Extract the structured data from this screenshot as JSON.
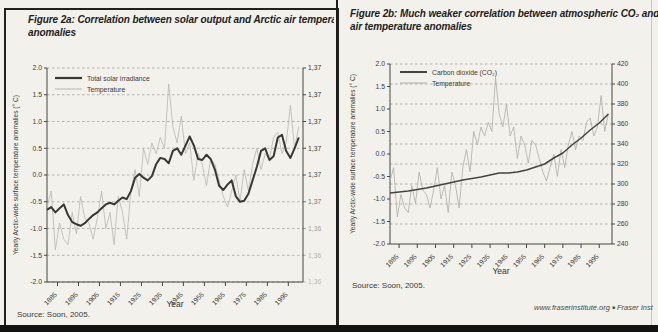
{
  "page": {
    "footer": {
      "url": "www.fraserinstitute.org",
      "separator": "■",
      "publication": "Fraser Inst"
    }
  },
  "panels": [
    {
      "title_line1": "Figure 2a: Correlation between solar output and Arctic air temperat",
      "title_line2": "anomalies",
      "source_note": "Source: Soon, 2005."
    },
    {
      "title_line1": "Figure 2b: Much weaker correlation between atmospheric CO₂ and Arc",
      "title_line2": "air temperature anomalies",
      "source_note": "Source: Soon, 2005."
    }
  ],
  "chart_data": [
    {
      "type": "line",
      "title": "Figure 2a: Correlation between solar output and Arctic air temperature anomalies",
      "xlabel": "Year",
      "ylabel": "Yearly Arctic-wide surface temperature anomalies (° C)",
      "xlim": [
        1880,
        2002
      ],
      "ylim_left": [
        -2.0,
        2.0
      ],
      "gridlines": {
        "axis": "left",
        "values": [
          2.0,
          1.5,
          1.0,
          0.5,
          0.0,
          -0.5,
          -1.0,
          -1.5,
          -2.0
        ]
      },
      "yticks_left": {
        "values": [
          2.0,
          1.5,
          1.0,
          0.5,
          0.0,
          -0.5,
          -1.0,
          -1.5,
          -2.0
        ],
        "labels": [
          "2.0",
          "1.5",
          "1.0",
          "0.5",
          "0.0",
          "-0.5",
          "-1.0",
          "-1.5",
          "-2.0"
        ]
      },
      "yticks_right": {
        "axis": "left",
        "values": [
          2.0,
          1.5,
          1.0,
          0.5,
          0.0,
          -0.5,
          -1.0,
          -1.5,
          -2.0
        ],
        "labels": [
          "1,37",
          "1,37",
          "1,37",
          "1,37",
          "1,37",
          "1,37",
          "1,36",
          "1,36",
          "1,36"
        ]
      },
      "xticks": {
        "values": [
          1885,
          1895,
          1905,
          1915,
          1925,
          1935,
          1945,
          1955,
          1965,
          1975,
          1985,
          1995
        ],
        "labels": [
          "1885",
          "1895",
          "1905",
          "1915",
          "1925",
          "1935",
          "1945",
          "1955",
          "1965",
          "1975",
          "1985",
          "1995"
        ]
      },
      "legend_position": "top-left-inside",
      "legend": [
        {
          "label": "Total solar irradiance",
          "color": "#383733",
          "width": 2.2
        },
        {
          "label": "Temperature",
          "color": "#b7b6ae",
          "width": 1
        }
      ],
      "series": [
        {
          "name": "Temperature",
          "axis": "left",
          "color": "#b7b6ae",
          "width": 0.8,
          "x": [
            1880,
            1882,
            1884,
            1886,
            1888,
            1890,
            1892,
            1894,
            1896,
            1898,
            1900,
            1902,
            1904,
            1906,
            1908,
            1910,
            1912,
            1914,
            1916,
            1918,
            1920,
            1922,
            1924,
            1926,
            1928,
            1930,
            1932,
            1934,
            1936,
            1938,
            1940,
            1942,
            1944,
            1946,
            1948,
            1950,
            1952,
            1954,
            1956,
            1958,
            1960,
            1962,
            1964,
            1966,
            1968,
            1970,
            1972,
            1974,
            1976,
            1978,
            1980,
            1982,
            1984,
            1986,
            1988,
            1990,
            1992,
            1994,
            1996,
            1998,
            2000
          ],
          "y": [
            -0.6,
            -0.3,
            -1.4,
            -0.9,
            -1.2,
            -1.3,
            -0.7,
            -1.1,
            -0.4,
            -0.8,
            -0.9,
            -1.2,
            -0.8,
            -0.3,
            -1.0,
            -0.7,
            -1.3,
            -0.4,
            -0.7,
            -1.2,
            -0.3,
            0.1,
            -0.4,
            0.5,
            0.2,
            0.6,
            0.4,
            0.7,
            0.5,
            1.7,
            0.9,
            0.6,
            1.1,
            0.4,
            0.6,
            -0.1,
            0.4,
            0.2,
            -0.2,
            0.3,
            0.2,
            -0.1,
            -0.4,
            -0.6,
            -0.3,
            0.0,
            -0.5,
            0.1,
            -0.3,
            0.2,
            0.5,
            0.1,
            0.4,
            0.3,
            0.7,
            0.8,
            0.4,
            0.6,
            1.3,
            0.5,
            0.9
          ]
        },
        {
          "name": "Total solar irradiance",
          "axis": "left",
          "color": "#383733",
          "width": 2,
          "x": [
            1880,
            1882,
            1884,
            1886,
            1888,
            1890,
            1892,
            1894,
            1896,
            1898,
            1900,
            1902,
            1904,
            1906,
            1908,
            1910,
            1912,
            1914,
            1916,
            1918,
            1920,
            1922,
            1924,
            1926,
            1928,
            1930,
            1932,
            1934,
            1936,
            1938,
            1940,
            1942,
            1944,
            1946,
            1948,
            1950,
            1952,
            1954,
            1956,
            1958,
            1960,
            1962,
            1964,
            1966,
            1968,
            1970,
            1972,
            1974,
            1976,
            1978,
            1980,
            1982,
            1984,
            1986,
            1988,
            1990,
            1992,
            1994,
            1996,
            1998,
            2000
          ],
          "y": [
            -0.65,
            -0.6,
            -0.7,
            -0.62,
            -0.55,
            -0.75,
            -0.88,
            -0.92,
            -0.95,
            -0.9,
            -0.82,
            -0.75,
            -0.7,
            -0.62,
            -0.55,
            -0.52,
            -0.55,
            -0.48,
            -0.42,
            -0.45,
            -0.3,
            -0.05,
            0.02,
            -0.05,
            -0.1,
            -0.02,
            0.2,
            0.32,
            0.3,
            0.22,
            0.45,
            0.5,
            0.38,
            0.55,
            0.72,
            0.55,
            0.3,
            0.28,
            0.38,
            0.3,
            0.1,
            -0.2,
            -0.28,
            -0.18,
            -0.1,
            -0.4,
            -0.5,
            -0.48,
            -0.35,
            -0.1,
            0.15,
            0.45,
            0.5,
            0.28,
            0.35,
            0.7,
            0.75,
            0.45,
            0.32,
            0.5,
            0.7
          ]
        }
      ]
    },
    {
      "type": "line",
      "title": "Figure 2b: Much weaker correlation between atmospheric CO₂ and Arctic air temperature anomalies",
      "xlabel": "Year",
      "ylabel": "Yearly Arctic-wide surface temperature anomalies (° C)",
      "xlim": [
        1880,
        2002
      ],
      "ylim_left": [
        -2.0,
        2.0
      ],
      "ylim_right": [
        240,
        420
      ],
      "gridlines": {
        "axis": "right",
        "values": [
          420,
          400,
          380,
          360,
          340,
          320,
          300,
          280,
          260
        ]
      },
      "yticks_left": {
        "values": [
          2.0,
          1.5,
          1.0,
          0.5,
          0.0,
          -0.5,
          -1.0,
          -1.5,
          -2.0
        ],
        "labels": [
          "2.0",
          "1.5",
          "1.0",
          "0.5",
          "0.0",
          "-0.5",
          "-1.0",
          "-1.5",
          "-2.0"
        ]
      },
      "yticks_right": {
        "axis": "right",
        "values": [
          420,
          400,
          380,
          360,
          340,
          320,
          300,
          280,
          260,
          240
        ],
        "labels": [
          "420",
          "400",
          "380",
          "360",
          "340",
          "320",
          "300",
          "280",
          "260",
          "240"
        ]
      },
      "xticks": {
        "values": [
          1885,
          1895,
          1905,
          1915,
          1925,
          1935,
          1945,
          1955,
          1965,
          1975,
          1985,
          1995
        ],
        "labels": [
          "1885",
          "1895",
          "1905",
          "1915",
          "1925",
          "1935",
          "1945",
          "1955",
          "1965",
          "1975",
          "1985",
          "1995"
        ]
      },
      "legend_position": "top-left-inside",
      "legend": [
        {
          "label": "Carbon dioxide (CO₂)",
          "color": "#45443f",
          "width": 2
        },
        {
          "label": "Temperature",
          "color": "#aeada5",
          "width": 1
        }
      ],
      "series": [
        {
          "name": "Temperature",
          "axis": "left",
          "color": "#aeada5",
          "width": 0.8,
          "x": [
            1880,
            1882,
            1884,
            1886,
            1888,
            1890,
            1892,
            1894,
            1896,
            1898,
            1900,
            1902,
            1904,
            1906,
            1908,
            1910,
            1912,
            1914,
            1916,
            1918,
            1920,
            1922,
            1924,
            1926,
            1928,
            1930,
            1932,
            1934,
            1936,
            1938,
            1940,
            1942,
            1944,
            1946,
            1948,
            1950,
            1952,
            1954,
            1956,
            1958,
            1960,
            1962,
            1964,
            1966,
            1968,
            1970,
            1972,
            1974,
            1976,
            1978,
            1980,
            1982,
            1984,
            1986,
            1988,
            1990,
            1992,
            1994,
            1996,
            1998,
            2000
          ],
          "y": [
            -0.6,
            -0.3,
            -1.4,
            -0.9,
            -1.2,
            -1.3,
            -0.7,
            -1.1,
            -0.4,
            -0.8,
            -0.9,
            -1.2,
            -0.8,
            -0.3,
            -1.0,
            -0.7,
            -1.3,
            -0.4,
            -0.7,
            -1.2,
            -0.3,
            0.1,
            -0.4,
            0.5,
            0.2,
            0.6,
            0.4,
            0.7,
            0.5,
            1.7,
            0.9,
            0.6,
            1.1,
            0.4,
            0.6,
            -0.1,
            0.4,
            0.2,
            -0.2,
            0.3,
            0.2,
            -0.1,
            -0.4,
            -0.6,
            -0.3,
            0.0,
            -0.5,
            0.1,
            -0.3,
            0.2,
            0.5,
            0.1,
            0.4,
            0.3,
            0.7,
            0.8,
            0.4,
            0.6,
            1.3,
            0.5,
            0.9
          ]
        },
        {
          "name": "Carbon dioxide (CO2)",
          "axis": "right",
          "color": "#45443f",
          "width": 1.5,
          "x": [
            1880,
            1890,
            1900,
            1910,
            1920,
            1930,
            1935,
            1940,
            1945,
            1950,
            1955,
            1960,
            1965,
            1970,
            1975,
            1980,
            1985,
            1990,
            1995,
            2000
          ],
          "y": [
            291,
            293,
            296,
            300,
            304,
            307,
            309,
            311,
            311,
            312,
            314,
            317,
            320,
            326,
            331,
            339,
            346,
            354,
            361,
            370
          ]
        }
      ]
    }
  ]
}
